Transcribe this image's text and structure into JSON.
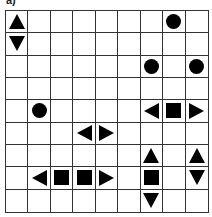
{
  "label": "a)",
  "grid": {
    "rows": 9,
    "cols": 9,
    "shapes": [
      {
        "row": 0,
        "col": 0,
        "shape": "triangle-up"
      },
      {
        "row": 0,
        "col": 7,
        "shape": "circle"
      },
      {
        "row": 1,
        "col": 0,
        "shape": "triangle-down"
      },
      {
        "row": 2,
        "col": 6,
        "shape": "circle"
      },
      {
        "row": 2,
        "col": 8,
        "shape": "circle"
      },
      {
        "row": 4,
        "col": 1,
        "shape": "circle"
      },
      {
        "row": 4,
        "col": 6,
        "shape": "triangle-left"
      },
      {
        "row": 4,
        "col": 7,
        "shape": "square"
      },
      {
        "row": 4,
        "col": 8,
        "shape": "triangle-right"
      },
      {
        "row": 5,
        "col": 3,
        "shape": "triangle-left"
      },
      {
        "row": 5,
        "col": 4,
        "shape": "triangle-right"
      },
      {
        "row": 6,
        "col": 6,
        "shape": "triangle-up"
      },
      {
        "row": 6,
        "col": 8,
        "shape": "triangle-up"
      },
      {
        "row": 7,
        "col": 1,
        "shape": "triangle-left"
      },
      {
        "row": 7,
        "col": 2,
        "shape": "square"
      },
      {
        "row": 7,
        "col": 3,
        "shape": "square"
      },
      {
        "row": 7,
        "col": 4,
        "shape": "triangle-right"
      },
      {
        "row": 7,
        "col": 6,
        "shape": "square"
      },
      {
        "row": 7,
        "col": 8,
        "shape": "triangle-down"
      },
      {
        "row": 8,
        "col": 6,
        "shape": "triangle-down"
      }
    ]
  }
}
